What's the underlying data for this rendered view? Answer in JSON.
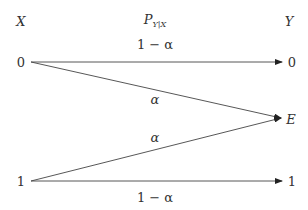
{
  "diagram": {
    "headers": {
      "input": "X",
      "channel_main": "P",
      "channel_sub": "Y|X",
      "output": "Y"
    },
    "inputs": [
      "0",
      "1"
    ],
    "outputs": [
      "0",
      "E",
      "1"
    ],
    "edges": [
      {
        "from": "0",
        "to": "0",
        "label": "1 − α"
      },
      {
        "from": "0",
        "to": "E",
        "label": "α"
      },
      {
        "from": "1",
        "to": "E",
        "label": "α"
      },
      {
        "from": "1",
        "to": "1",
        "label": "1 − α"
      }
    ],
    "colors": {
      "line": "#444444",
      "text": "#333333",
      "background": "#ffffff"
    }
  }
}
